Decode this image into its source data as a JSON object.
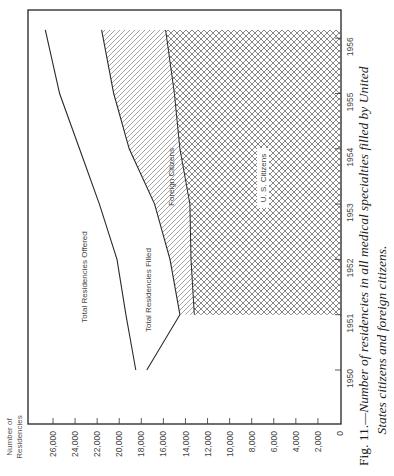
{
  "chart_data": {
    "type": "area",
    "orientation": "rotated-90-ccw",
    "title": "",
    "caption_prefix": "Fig. 11.",
    "caption_line1": "—Number of residencies in all medical specialties filled by United",
    "caption_line2": "States citizens and foreign citizens.",
    "ylabel_line1": "Number of",
    "ylabel_line2": "Residencies",
    "xlabel": "",
    "ylim": [
      0,
      26000
    ],
    "y_ticks": [
      0,
      2000,
      4000,
      6000,
      8000,
      10000,
      12000,
      14000,
      16000,
      18000,
      20000,
      22000,
      24000,
      26000
    ],
    "y_tick_labels": [
      "0",
      "2,000",
      "4,000",
      "6,000",
      "8,000",
      "10,000",
      "12,000",
      "14,000",
      "16,000",
      "18,000",
      "20,000",
      "22,000",
      "24,000",
      "26,000"
    ],
    "x_ticks": [
      1950,
      1951,
      1952,
      1953,
      1954,
      1955,
      1956
    ],
    "x_tick_labels": [
      "1950",
      "1951",
      "1952",
      "1953",
      "1954",
      "1955",
      "1956"
    ],
    "grid": false,
    "series": [
      {
        "name": "Total Residencies Offered",
        "style": "line",
        "x": [
          1950,
          1951,
          1952,
          1953,
          1954,
          1955,
          1956.15
        ],
        "values": [
          18500,
          19400,
          20200,
          21800,
          23600,
          25400,
          26700
        ]
      },
      {
        "name": "Total Residencies Filled",
        "style": "line",
        "x": [
          1950,
          1951,
          1952,
          1953,
          1954,
          1955,
          1956.15
        ],
        "values": [
          17500,
          14500,
          15400,
          16800,
          19100,
          20500,
          21600
        ]
      },
      {
        "name": "U. S. Citizens",
        "style": "crosshatch-area",
        "x": [
          1951,
          1952,
          1953,
          1954,
          1955,
          1956.15
        ],
        "values": [
          13200,
          13500,
          13600,
          14500,
          15000,
          15800
        ]
      },
      {
        "name": "Foreign Citizens",
        "style": "diagonal-hatch-area",
        "note": "region between Total Residencies Filled and U. S. Citizens",
        "x": [
          1951,
          1952,
          1953,
          1954,
          1955,
          1956.15
        ],
        "values": [
          1300,
          1900,
          3200,
          4600,
          5500,
          5800
        ]
      }
    ],
    "labels": {
      "offered": "Total Residencies Offered",
      "filled": "Total Residencies Filled",
      "foreign": "Foreign Citizens",
      "us": "U. S. Citizens"
    }
  },
  "colors": {
    "line": "#2a2a2a",
    "hatch": "#555555",
    "frame": "#222222",
    "text": "#444444"
  }
}
